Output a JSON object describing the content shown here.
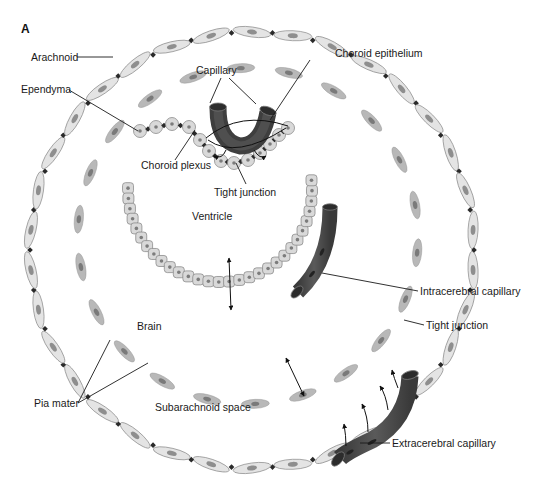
{
  "figure": {
    "panel_label": "A",
    "labels": {
      "arachnoid": "Arachnoid",
      "ependyma": "Ependyma",
      "capillary": "Capillary",
      "choroid_epithelium": "Choroid epithelium",
      "choroid_plexus": "Choroid plexus",
      "tight_junction_top": "Tight junction",
      "ventricle": "Ventricle",
      "intracerebral_capillary": "Intracerebral capillary",
      "tight_junction_right": "Tight junction",
      "brain": "Brain",
      "pia_mater": "Pia mater",
      "subarachnoid_space": "Subarachnoid space",
      "extracerebral_capillary": "Extracerebral capillary"
    },
    "colors": {
      "capillary": "#4a4a4a",
      "cell_fill": "#e4e4e4",
      "pia_fill": "#b8b8b8",
      "ependyma_fill": "#d9d9d9",
      "tight_junction": "#2a2a2a"
    }
  }
}
